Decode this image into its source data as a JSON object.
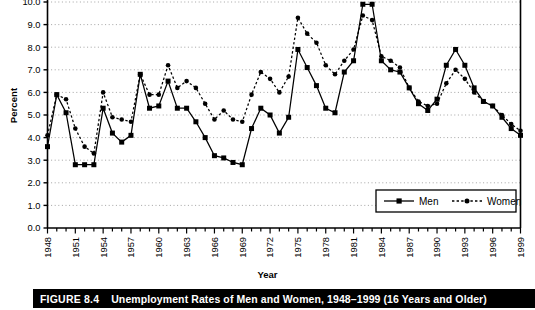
{
  "figure": {
    "caption_number": "FIGURE 8.4",
    "caption_title": "Unemployment Rates of Men and Women, 1948–1999 (16 Years and Older)"
  },
  "chart_data": {
    "type": "line",
    "title": "",
    "xlabel": "Year",
    "ylabel": "Percent",
    "ylim": [
      0.0,
      10.0
    ],
    "ytick_labels": [
      "0.0",
      "1.0",
      "2.0",
      "3.0",
      "4.0",
      "5.0",
      "6.0",
      "7.0",
      "8.0",
      "9.0",
      "10.0"
    ],
    "ytick_values": [
      0.0,
      1.0,
      2.0,
      3.0,
      4.0,
      5.0,
      6.0,
      7.0,
      8.0,
      9.0,
      10.0
    ],
    "grid": true,
    "grid_style": "dotted-horizontal",
    "legend_position": "lower-right",
    "x": [
      1948,
      1949,
      1950,
      1951,
      1952,
      1953,
      1954,
      1955,
      1956,
      1957,
      1958,
      1959,
      1960,
      1961,
      1962,
      1963,
      1964,
      1965,
      1966,
      1967,
      1968,
      1969,
      1970,
      1971,
      1972,
      1973,
      1974,
      1975,
      1976,
      1977,
      1978,
      1979,
      1980,
      1981,
      1982,
      1983,
      1984,
      1985,
      1986,
      1987,
      1988,
      1989,
      1990,
      1991,
      1992,
      1993,
      1994,
      1995,
      1996,
      1997,
      1998,
      1999
    ],
    "xtick_labels": [
      "1948",
      "1951",
      "1954",
      "1957",
      "1960",
      "1963",
      "1966",
      "1969",
      "1972",
      "1975",
      "1978",
      "1981",
      "1984",
      "1987",
      "1990",
      "1993",
      "1996",
      "1999"
    ],
    "xtick_values": [
      1948,
      1951,
      1954,
      1957,
      1960,
      1963,
      1966,
      1969,
      1972,
      1975,
      1978,
      1981,
      1984,
      1987,
      1990,
      1993,
      1996,
      1999
    ],
    "xlim": [
      1948,
      1999
    ],
    "series": [
      {
        "name": "Men",
        "marker": "square",
        "line": "solid",
        "color": "#000000",
        "values": [
          3.6,
          5.9,
          5.1,
          2.8,
          2.8,
          2.8,
          5.3,
          4.2,
          3.8,
          4.1,
          6.8,
          5.3,
          5.4,
          6.5,
          5.3,
          5.3,
          4.7,
          4.0,
          3.2,
          3.1,
          2.9,
          2.8,
          4.4,
          5.3,
          5.0,
          4.2,
          4.9,
          7.9,
          7.1,
          6.3,
          5.3,
          5.1,
          6.9,
          7.4,
          9.9,
          9.9,
          7.4,
          7.0,
          6.9,
          6.2,
          5.5,
          5.2,
          5.7,
          7.2,
          7.9,
          7.2,
          6.2,
          5.6,
          5.4,
          4.9,
          4.4,
          4.1
        ]
      },
      {
        "name": "Women",
        "marker": "circle",
        "line": "dotted",
        "color": "#000000",
        "values": [
          4.1,
          5.9,
          5.7,
          4.4,
          3.6,
          3.3,
          6.0,
          4.9,
          4.8,
          4.7,
          6.8,
          5.9,
          5.9,
          7.2,
          6.2,
          6.5,
          6.2,
          5.5,
          4.8,
          5.2,
          4.8,
          4.7,
          5.9,
          6.9,
          6.6,
          6.0,
          6.7,
          9.3,
          8.6,
          8.2,
          7.2,
          6.8,
          7.4,
          7.9,
          9.4,
          9.2,
          7.6,
          7.4,
          7.1,
          6.2,
          5.6,
          5.4,
          5.5,
          6.4,
          7.0,
          6.6,
          6.0,
          5.6,
          5.4,
          5.0,
          4.6,
          4.3
        ]
      }
    ]
  },
  "legend": {
    "items": [
      {
        "label": "Men"
      },
      {
        "label": "Women"
      }
    ]
  }
}
